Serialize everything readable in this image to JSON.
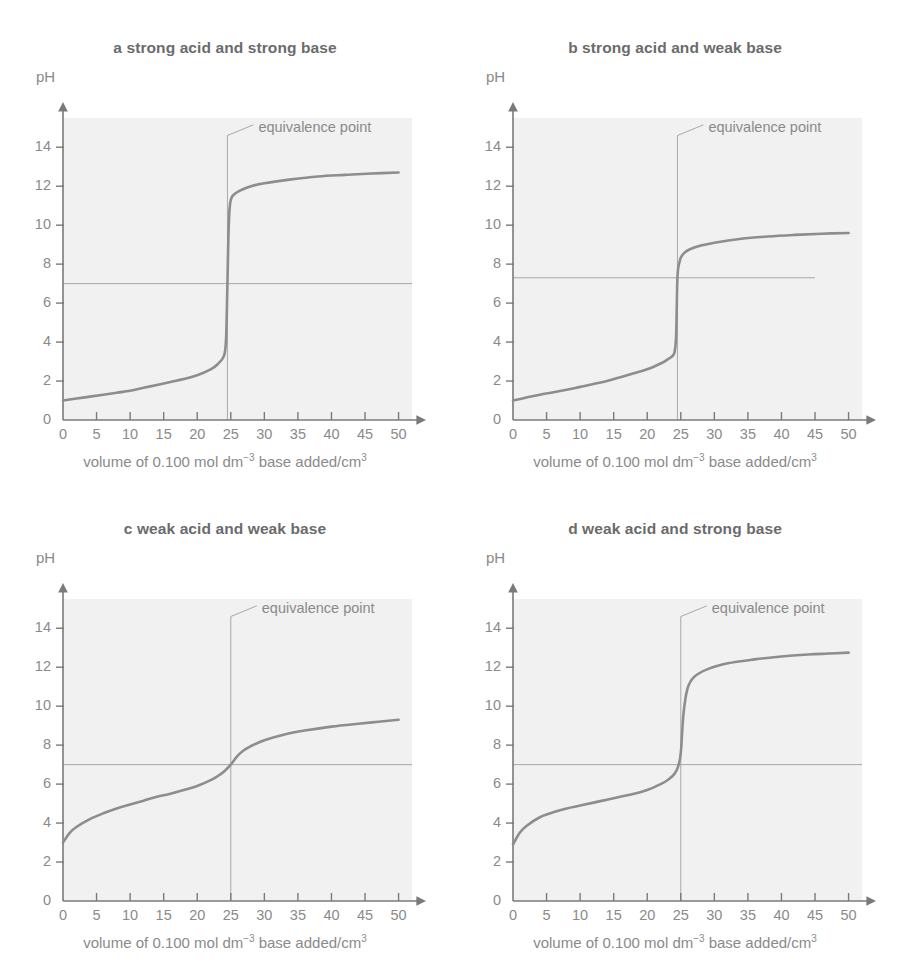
{
  "figure": {
    "axis_label_y": "pH",
    "axis_label_x_parts": {
      "pre": "volume of 0.100 mol dm",
      "sup1": "−3",
      "mid": "base added/cm",
      "sup2": "3"
    },
    "annotation": "equivalence point",
    "colors": {
      "plot_background": "#f1f1f1",
      "curve": "#8d8d8d",
      "axis": "#7a7a7a",
      "text": "#8a8a8a",
      "title_text": "#6b6b6b",
      "guide_line": "#a8a8a8"
    }
  },
  "chart_data": [
    {
      "type": "line",
      "panel": "a",
      "title": "a strong acid and strong base",
      "xlabel": "volume of 0.100 mol dm-3 base added/cm3",
      "ylabel": "pH",
      "xlim": [
        0,
        52
      ],
      "ylim": [
        0,
        15.5
      ],
      "xticks": [
        0,
        5,
        10,
        15,
        20,
        25,
        30,
        35,
        40,
        45,
        50
      ],
      "yticks": [
        0,
        2,
        4,
        6,
        8,
        10,
        12,
        14
      ],
      "grid": false,
      "equivalence_point_volume": 24.5,
      "equivalence_point_ph": 7.0,
      "horizontal_guide_ph": 7.0,
      "horizontal_guide_extent": [
        0,
        52
      ],
      "annotation": "equivalence point",
      "x": [
        0,
        2,
        4,
        6,
        8,
        10,
        12,
        14,
        16,
        18,
        20,
        22,
        23,
        24,
        24.3,
        24.5,
        24.7,
        25,
        26,
        28,
        30,
        34,
        38,
        42,
        46,
        50
      ],
      "y": [
        1.0,
        1.1,
        1.2,
        1.3,
        1.4,
        1.5,
        1.65,
        1.8,
        1.95,
        2.1,
        2.3,
        2.6,
        2.85,
        3.3,
        4.2,
        7.0,
        10.0,
        11.3,
        11.7,
        12.0,
        12.15,
        12.35,
        12.5,
        12.58,
        12.65,
        12.7
      ]
    },
    {
      "type": "line",
      "panel": "b",
      "title": "b strong acid and weak base",
      "xlabel": "volume of 0.100 mol dm-3 base added/cm3",
      "ylabel": "pH",
      "xlim": [
        0,
        52
      ],
      "ylim": [
        0,
        15.5
      ],
      "xticks": [
        0,
        5,
        10,
        15,
        20,
        25,
        30,
        35,
        40,
        45,
        50
      ],
      "yticks": [
        0,
        2,
        4,
        6,
        8,
        10,
        12,
        14
      ],
      "grid": false,
      "equivalence_point_volume": 24.5,
      "equivalence_point_ph": 7.3,
      "horizontal_guide_ph": 7.3,
      "horizontal_guide_extent": [
        0,
        45
      ],
      "annotation": "equivalence point",
      "x": [
        0,
        2,
        4,
        6,
        8,
        10,
        12,
        14,
        16,
        18,
        20,
        22,
        23,
        24,
        24.3,
        24.5,
        24.8,
        25.2,
        26,
        28,
        30,
        34,
        38,
        42,
        46,
        50
      ],
      "y": [
        1.0,
        1.15,
        1.3,
        1.42,
        1.55,
        1.7,
        1.85,
        2.0,
        2.2,
        2.4,
        2.6,
        2.9,
        3.1,
        3.4,
        4.3,
        7.3,
        8.1,
        8.45,
        8.7,
        8.95,
        9.1,
        9.3,
        9.42,
        9.5,
        9.56,
        9.6
      ]
    },
    {
      "type": "line",
      "panel": "c",
      "title": "c weak acid and weak base",
      "xlabel": "volume of 0.100 mol dm-3 base added/cm3",
      "ylabel": "pH",
      "xlim": [
        0,
        52
      ],
      "ylim": [
        0,
        15.5
      ],
      "xticks": [
        0,
        5,
        10,
        15,
        20,
        25,
        30,
        35,
        40,
        45,
        50
      ],
      "yticks": [
        0,
        2,
        4,
        6,
        8,
        10,
        12,
        14
      ],
      "grid": false,
      "equivalence_point_volume": 25,
      "equivalence_point_ph": 7.0,
      "horizontal_guide_ph": 7.0,
      "horizontal_guide_extent": [
        0,
        52
      ],
      "annotation": "equivalence point",
      "x": [
        0,
        1,
        2,
        4,
        6,
        8,
        10,
        12,
        14,
        16,
        18,
        20,
        22,
        23,
        24,
        25,
        26,
        27,
        28,
        30,
        33,
        36,
        40,
        44,
        47,
        50
      ],
      "y": [
        3.0,
        3.5,
        3.8,
        4.2,
        4.5,
        4.75,
        4.95,
        5.15,
        5.35,
        5.5,
        5.7,
        5.9,
        6.2,
        6.4,
        6.65,
        7.0,
        7.45,
        7.75,
        7.95,
        8.25,
        8.55,
        8.75,
        8.95,
        9.1,
        9.2,
        9.3
      ]
    },
    {
      "type": "line",
      "panel": "d",
      "title": "d weak acid and strong base",
      "xlabel": "volume of 0.100 mol dm-3 base added/cm3",
      "ylabel": "pH",
      "xlim": [
        0,
        52
      ],
      "ylim": [
        0,
        15.5
      ],
      "xticks": [
        0,
        5,
        10,
        15,
        20,
        25,
        30,
        35,
        40,
        45,
        50
      ],
      "yticks": [
        0,
        2,
        4,
        6,
        8,
        10,
        12,
        14
      ],
      "grid": false,
      "equivalence_point_volume": 25,
      "equivalence_point_ph": 7.0,
      "horizontal_guide_ph": 7.0,
      "horizontal_guide_extent": [
        0,
        52
      ],
      "annotation": "equivalence point",
      "x": [
        0,
        1,
        2,
        4,
        6,
        8,
        10,
        12,
        14,
        16,
        18,
        20,
        22,
        23,
        24,
        24.6,
        25,
        25.4,
        26,
        27,
        29,
        32,
        36,
        40,
        44,
        47,
        50
      ],
      "y": [
        2.9,
        3.5,
        3.85,
        4.3,
        4.55,
        4.75,
        4.9,
        5.05,
        5.2,
        5.35,
        5.5,
        5.7,
        6.0,
        6.2,
        6.5,
        6.9,
        7.6,
        9.6,
        10.9,
        11.5,
        11.9,
        12.2,
        12.4,
        12.55,
        12.65,
        12.7,
        12.75
      ]
    }
  ]
}
